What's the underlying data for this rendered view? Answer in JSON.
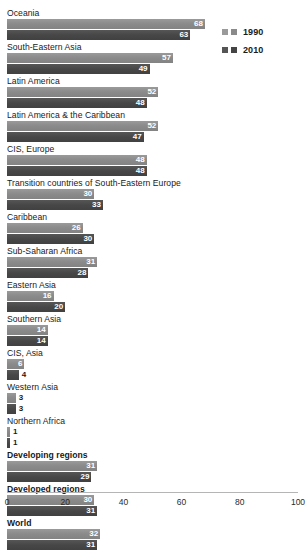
{
  "legend": {
    "entries": [
      {
        "label": "1990",
        "color_light": "#8c8c8c",
        "color_dark": "#8c8c8c"
      },
      {
        "label": "2010",
        "color_light": "#4a4a4a",
        "color_dark": "#4a4a4a"
      }
    ]
  },
  "chart_data": {
    "type": "bar",
    "orientation": "horizontal",
    "title": "",
    "xlabel": "",
    "ylabel": "",
    "xlim": [
      0,
      100
    ],
    "grid": false,
    "legend_position": "top-right",
    "categories": [
      "Oceania",
      "South-Eastern Asia",
      "Latin America",
      "Latin America & the Caribbean",
      "CIS, Europe",
      "Transition countries of South-Eastern Europe",
      "Caribbean",
      "Sub-Saharan Africa",
      "Eastern Asia",
      "Southern Asia",
      "CIS, Asia",
      "Western Asia",
      "Northern Africa",
      "Developing regions",
      "Developed regions",
      "World"
    ],
    "emphasized": [
      false,
      false,
      false,
      false,
      false,
      false,
      false,
      false,
      false,
      false,
      false,
      false,
      false,
      true,
      true,
      true
    ],
    "ticks": [
      0,
      20,
      40,
      60,
      80,
      100
    ],
    "series": [
      {
        "name": "1990",
        "values": [
          68,
          57,
          52,
          52,
          48,
          30,
          26,
          31,
          16,
          14,
          6,
          3,
          1,
          31,
          30,
          32
        ]
      },
      {
        "name": "2010",
        "values": [
          63,
          49,
          48,
          47,
          48,
          33,
          30,
          28,
          20,
          14,
          4,
          3,
          1,
          29,
          31,
          31
        ]
      }
    ]
  }
}
